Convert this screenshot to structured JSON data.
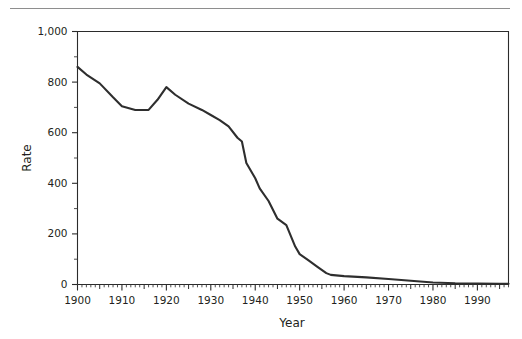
{
  "figure": {
    "has_top_rule": true,
    "background_color": "#ffffff",
    "line_color": "#2e2e2e",
    "axis_color": "#2b2b2b",
    "rule_color": "#8e8e8e"
  },
  "chart_data": {
    "type": "line",
    "title": "",
    "xlabel": "Year",
    "ylabel": "Rate",
    "xlim": [
      1900,
      1997
    ],
    "ylim": [
      0,
      1000
    ],
    "grid": false,
    "legend": null,
    "x_major_ticks": [
      1900,
      1910,
      1920,
      1930,
      1940,
      1950,
      1960,
      1970,
      1980,
      1990
    ],
    "x_tick_labels": [
      "1900",
      "1910",
      "1920",
      "1930",
      "1940",
      "1950",
      "1960",
      "1970",
      "1980",
      "1990"
    ],
    "x_minor_tick_interval": 1,
    "x_medium_tick_interval": 5,
    "y_major_ticks": [
      0,
      200,
      400,
      600,
      800,
      1000
    ],
    "y_tick_labels": [
      "0",
      "200",
      "400",
      "600",
      "800",
      "1,000"
    ],
    "y_minor_ticks": [
      100,
      300,
      500,
      700,
      900
    ],
    "series": [
      {
        "name": "Rate",
        "x": [
          1900,
          1902,
          1905,
          1908,
          1910,
          1913,
          1916,
          1918,
          1920,
          1922,
          1925,
          1928,
          1930,
          1932,
          1934,
          1936,
          1937,
          1938,
          1940,
          1941,
          1943,
          1945,
          1947,
          1949,
          1950,
          1952,
          1954,
          1956,
          1957,
          1960,
          1965,
          1970,
          1975,
          1980,
          1985,
          1990,
          1995,
          1997
        ],
        "y": [
          860,
          830,
          795,
          740,
          705,
          690,
          690,
          730,
          780,
          750,
          715,
          690,
          670,
          650,
          625,
          580,
          565,
          480,
          420,
          380,
          330,
          260,
          235,
          150,
          120,
          95,
          70,
          45,
          38,
          33,
          28,
          22,
          15,
          8,
          5,
          4,
          3,
          3
        ]
      }
    ]
  }
}
